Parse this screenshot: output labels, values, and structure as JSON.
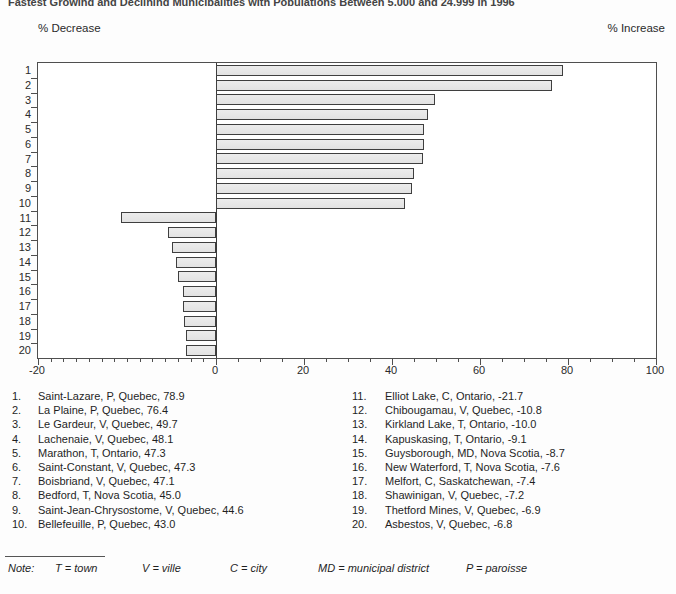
{
  "title": "Fastest Growing and Declining Municipalities with Populations Between 5,000 and 24,999 in 1996",
  "header": {
    "decrease_label": "% Decrease",
    "increase_label": "% Increase"
  },
  "chart_data": {
    "type": "bar",
    "orientation": "horizontal",
    "title": "Fastest Growing and Declining Municipalities with Populations Between 5,000 and 24,999 in 1996",
    "categories": [
      "1",
      "2",
      "3",
      "4",
      "5",
      "6",
      "7",
      "8",
      "9",
      "10",
      "11",
      "12",
      "13",
      "14",
      "15",
      "16",
      "17",
      "18",
      "19",
      "20"
    ],
    "values": [
      78.9,
      76.4,
      49.7,
      48.1,
      47.3,
      47.3,
      47.1,
      45.0,
      44.6,
      43.0,
      -21.7,
      -10.8,
      -10.0,
      -9.1,
      -8.7,
      -7.6,
      -7.4,
      -7.2,
      -6.9,
      -6.8
    ],
    "series_name": "% population change",
    "xlabel": "",
    "ylabel": "rank",
    "xlim": [
      -20,
      100
    ],
    "x_tick_labels": [
      "-20",
      "0",
      "20",
      "40",
      "60",
      "80",
      "100"
    ],
    "grid": false,
    "legend_position": "none",
    "bar_fill": "#e8e8e8",
    "bar_border": "#3f3f3f"
  },
  "rankings": {
    "left": [
      {
        "rank": "1.",
        "label": "Saint-Lazare, P, Quebec, 78.9"
      },
      {
        "rank": "2.",
        "label": "La Plaine, P, Quebec, 76.4"
      },
      {
        "rank": "3.",
        "label": "Le Gardeur, V, Quebec, 49.7"
      },
      {
        "rank": "4.",
        "label": "Lachenaie, V, Quebec, 48.1"
      },
      {
        "rank": "5.",
        "label": "Marathon, T, Ontario, 47.3"
      },
      {
        "rank": "6.",
        "label": "Saint-Constant, V, Quebec, 47.3"
      },
      {
        "rank": "7.",
        "label": "Boisbriand, V, Quebec, 47.1"
      },
      {
        "rank": "8.",
        "label": "Bedford, T, Nova Scotia, 45.0"
      },
      {
        "rank": "9.",
        "label": "Saint-Jean-Chrysostome, V, Quebec, 44.6"
      },
      {
        "rank": "10.",
        "label": "Bellefeuille, P, Quebec, 43.0"
      }
    ],
    "right": [
      {
        "rank": "11.",
        "label": "Elliot Lake, C, Ontario, -21.7"
      },
      {
        "rank": "12.",
        "label": "Chibougamau, V, Quebec, -10.8"
      },
      {
        "rank": "13.",
        "label": "Kirkland Lake, T, Ontario, -10.0"
      },
      {
        "rank": "14.",
        "label": "Kapuskasing, T, Ontario, -9.1"
      },
      {
        "rank": "15.",
        "label": "Guysborough, MD, Nova Scotia, -8.7"
      },
      {
        "rank": "16.",
        "label": "New Waterford, T, Nova Scotia, -7.6"
      },
      {
        "rank": "17.",
        "label": "Melfort, C, Saskatchewan, -7.4"
      },
      {
        "rank": "18.",
        "label": "Shawinigan, V, Quebec, -7.2"
      },
      {
        "rank": "19.",
        "label": "Thetford Mines, V, Quebec, -6.9"
      },
      {
        "rank": "20.",
        "label": "Asbestos, V, Quebec, -6.8"
      }
    ]
  },
  "note": {
    "label": "Note:",
    "items": [
      "T = town",
      "V = ville",
      "C = city",
      "MD = municipal district",
      "P = paroisse"
    ]
  }
}
